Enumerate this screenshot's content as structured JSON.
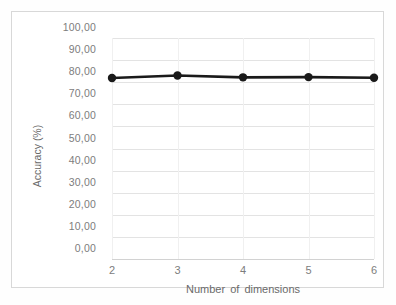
{
  "chart_data": {
    "type": "line",
    "title": "",
    "subtitle": "",
    "xlabel": "Number of dimensions",
    "ylabel": "Accuracy (%)",
    "x": [
      2,
      3,
      4,
      5,
      6
    ],
    "values": [
      81.9,
      83.0,
      82.2,
      82.3,
      82.0
    ],
    "series": [
      {
        "name": "Accuracy",
        "x": [
          2,
          3,
          4,
          5,
          6
        ],
        "values": [
          81.9,
          83.0,
          82.2,
          82.3,
          82.0
        ]
      }
    ],
    "xlim": [
      2,
      6
    ],
    "ylim": [
      0,
      100
    ],
    "x_tick_labels": [
      "2",
      "3",
      "4",
      "5",
      "6"
    ],
    "y_tick_labels": [
      "0,00",
      "10,00",
      "20,00",
      "30,00",
      "40,00",
      "50,00",
      "60,00",
      "70,00",
      "80,00",
      "90,00",
      "100,00"
    ],
    "y_ticks": [
      0,
      10,
      20,
      30,
      40,
      50,
      60,
      70,
      80,
      90,
      100
    ],
    "decimal_separator": ",",
    "grid": {
      "horizontal": true,
      "vertical": true
    },
    "legend": {
      "visible": false,
      "position": "none",
      "entries": []
    },
    "marker": "circle",
    "colors": {
      "line": "#1a1a1a",
      "marker": "#1a1a1a",
      "gridline": "#e3e3e3",
      "vertical_gridline": "#f0f0f0",
      "tick_label": "#7d7d7d",
      "axis_title": "#6a6a6a",
      "frame_border": "#d8d8d8",
      "background": "#ffffff"
    }
  }
}
